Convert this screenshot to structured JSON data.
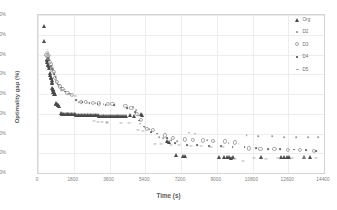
{
  "chart_data": {
    "type": "scatter",
    "title": "",
    "xlabel": "Time (s)",
    "ylabel": "Optimality gap (%)",
    "xlim": [
      0,
      14400
    ],
    "ylim": [
      0,
      0.8
    ],
    "grid": true,
    "legend_position": "right",
    "xticks": [
      "0",
      "1800",
      "3600",
      "5400",
      "7200",
      "9000",
      "10800",
      "12600",
      "14400"
    ],
    "xtick_values": [
      0,
      1800,
      3600,
      5400,
      7200,
      9000,
      10800,
      12600,
      14400
    ],
    "yticks": [
      "0%",
      "10%",
      "20%",
      "30%",
      "40%",
      "50%",
      "60%",
      "70%",
      "80%"
    ],
    "ytick_values": [
      0,
      0.1,
      0.2,
      0.3,
      0.4,
      0.5,
      0.6,
      0.7,
      0.8
    ],
    "series": [
      {
        "name": "Org",
        "marker": "triangle",
        "color": "#4a4a4a",
        "points": [
          [
            300,
            0.742
          ],
          [
            320,
            0.668
          ],
          [
            430,
            0.578
          ],
          [
            470,
            0.572
          ],
          [
            455,
            0.56
          ],
          [
            500,
            0.545
          ],
          [
            520,
            0.552
          ],
          [
            560,
            0.54
          ],
          [
            545,
            0.53
          ],
          [
            600,
            0.505
          ],
          [
            620,
            0.498
          ],
          [
            640,
            0.487
          ],
          [
            660,
            0.48
          ],
          [
            680,
            0.47
          ],
          [
            700,
            0.462
          ],
          [
            690,
            0.455
          ],
          [
            730,
            0.432
          ],
          [
            750,
            0.425
          ],
          [
            770,
            0.418
          ],
          [
            760,
            0.412
          ],
          [
            800,
            0.408
          ],
          [
            820,
            0.4
          ],
          [
            840,
            0.398
          ],
          [
            900,
            0.352
          ],
          [
            930,
            0.35
          ],
          [
            960,
            0.348
          ],
          [
            990,
            0.345
          ],
          [
            1010,
            0.343
          ],
          [
            1040,
            0.34
          ],
          [
            1150,
            0.302
          ],
          [
            1200,
            0.301
          ],
          [
            1260,
            0.3
          ],
          [
            1320,
            0.3
          ],
          [
            1390,
            0.299
          ],
          [
            1450,
            0.299
          ],
          [
            1520,
            0.298
          ],
          [
            1580,
            0.298
          ],
          [
            1650,
            0.298
          ],
          [
            1720,
            0.297
          ],
          [
            1790,
            0.297
          ],
          [
            1860,
            0.297
          ],
          [
            1930,
            0.296
          ],
          [
            2000,
            0.296
          ],
          [
            2080,
            0.296
          ],
          [
            2150,
            0.295
          ],
          [
            2230,
            0.295
          ],
          [
            2300,
            0.295
          ],
          [
            2380,
            0.294
          ],
          [
            2450,
            0.294
          ],
          [
            2530,
            0.294
          ],
          [
            2610,
            0.293
          ],
          [
            2690,
            0.293
          ],
          [
            2770,
            0.293
          ],
          [
            2850,
            0.292
          ],
          [
            2930,
            0.292
          ],
          [
            3010,
            0.292
          ],
          [
            3090,
            0.291
          ],
          [
            3180,
            0.291
          ],
          [
            3260,
            0.291
          ],
          [
            3340,
            0.29
          ],
          [
            3430,
            0.29
          ],
          [
            3510,
            0.29
          ],
          [
            3600,
            0.29
          ],
          [
            3690,
            0.289
          ],
          [
            3780,
            0.289
          ],
          [
            3870,
            0.289
          ],
          [
            3960,
            0.288
          ],
          [
            4050,
            0.288
          ],
          [
            4140,
            0.288
          ],
          [
            4240,
            0.287
          ],
          [
            4330,
            0.287
          ],
          [
            4430,
            0.287
          ],
          [
            4650,
            0.292
          ],
          [
            4820,
            0.29
          ],
          [
            5180,
            0.297
          ],
          [
            5260,
            0.295
          ],
          [
            6480,
            0.16
          ],
          [
            6600,
            0.158
          ],
          [
            6950,
            0.09
          ],
          [
            7300,
            0.088
          ],
          [
            7420,
            0.086
          ],
          [
            9120,
            0.082
          ],
          [
            9350,
            0.08
          ],
          [
            9500,
            0.079
          ],
          [
            9620,
            0.08
          ],
          [
            9700,
            0.078
          ],
          [
            9800,
            0.079
          ],
          [
            11250,
            0.08
          ],
          [
            12250,
            0.082
          ],
          [
            12400,
            0.081
          ],
          [
            12520,
            0.082
          ],
          [
            12650,
            0.08
          ],
          [
            13400,
            0.081
          ],
          [
            13700,
            0.08
          ]
        ]
      },
      {
        "name": "D2",
        "marker": "dot",
        "color": "#9a9a9a",
        "points": [
          [
            480,
            0.625
          ],
          [
            520,
            0.608
          ],
          [
            540,
            0.6
          ],
          [
            660,
            0.54
          ],
          [
            700,
            0.53
          ],
          [
            760,
            0.52
          ],
          [
            810,
            0.505
          ],
          [
            900,
            0.47
          ],
          [
            980,
            0.455
          ],
          [
            1150,
            0.42
          ],
          [
            1260,
            0.418
          ],
          [
            1500,
            0.4
          ],
          [
            1620,
            0.398
          ],
          [
            2050,
            0.358
          ],
          [
            2200,
            0.355
          ],
          [
            2900,
            0.355
          ],
          [
            3100,
            0.352
          ],
          [
            3300,
            0.35
          ],
          [
            4800,
            0.335
          ],
          [
            4950,
            0.318
          ],
          [
            5050,
            0.29
          ],
          [
            5150,
            0.25
          ],
          [
            5400,
            0.23
          ],
          [
            5600,
            0.222
          ],
          [
            6100,
            0.18
          ],
          [
            6300,
            0.175
          ],
          [
            6700,
            0.168
          ],
          [
            7000,
            0.16
          ],
          [
            7600,
            0.205
          ],
          [
            7900,
            0.2
          ],
          [
            8500,
            0.165
          ],
          [
            8900,
            0.16
          ],
          [
            9600,
            0.15
          ],
          [
            10100,
            0.148
          ],
          [
            10500,
            0.19
          ],
          [
            11100,
            0.188
          ],
          [
            11800,
            0.185
          ],
          [
            12400,
            0.183
          ],
          [
            13000,
            0.182
          ],
          [
            13600,
            0.182
          ],
          [
            14100,
            0.18
          ]
        ]
      },
      {
        "name": "D3",
        "marker": "open-circle",
        "color": "#a8a8a8",
        "points": [
          [
            420,
            0.6
          ],
          [
            470,
            0.592
          ],
          [
            510,
            0.585
          ],
          [
            580,
            0.562
          ],
          [
            630,
            0.55
          ],
          [
            720,
            0.525
          ],
          [
            790,
            0.512
          ],
          [
            870,
            0.48
          ],
          [
            940,
            0.462
          ],
          [
            1100,
            0.438
          ],
          [
            1250,
            0.425
          ],
          [
            1480,
            0.405
          ],
          [
            1700,
            0.395
          ],
          [
            2150,
            0.362
          ],
          [
            2400,
            0.358
          ],
          [
            2750,
            0.355
          ],
          [
            3050,
            0.352
          ],
          [
            3500,
            0.35
          ],
          [
            3750,
            0.348
          ],
          [
            4400,
            0.338
          ],
          [
            4700,
            0.33
          ],
          [
            5000,
            0.3
          ],
          [
            5200,
            0.27
          ],
          [
            5500,
            0.222
          ],
          [
            5800,
            0.218
          ],
          [
            6400,
            0.19
          ],
          [
            6800,
            0.178
          ],
          [
            7400,
            0.17
          ],
          [
            7800,
            0.168
          ],
          [
            8300,
            0.165
          ],
          [
            8800,
            0.162
          ],
          [
            9400,
            0.16
          ],
          [
            9900,
            0.155
          ],
          [
            10600,
            0.125
          ],
          [
            11200,
            0.122
          ],
          [
            11900,
            0.12
          ],
          [
            12600,
            0.118
          ],
          [
            13200,
            0.115
          ],
          [
            13900,
            0.112
          ]
        ]
      },
      {
        "name": "D4",
        "marker": "square",
        "color": "#6d6d6d",
        "points": [
          [
            500,
            0.582
          ],
          [
            560,
            0.57
          ],
          [
            640,
            0.54
          ],
          [
            710,
            0.528
          ],
          [
            820,
            0.5
          ],
          [
            890,
            0.485
          ],
          [
            1020,
            0.448
          ],
          [
            1180,
            0.432
          ],
          [
            1350,
            0.412
          ],
          [
            1550,
            0.402
          ],
          [
            1900,
            0.37
          ],
          [
            2250,
            0.36
          ],
          [
            2600,
            0.352
          ],
          [
            3000,
            0.348
          ],
          [
            3400,
            0.345
          ],
          [
            3850,
            0.342
          ],
          [
            4500,
            0.33
          ],
          [
            4900,
            0.31
          ],
          [
            5100,
            0.265
          ],
          [
            5350,
            0.235
          ],
          [
            5700,
            0.208
          ],
          [
            6000,
            0.2
          ],
          [
            6500,
            0.175
          ],
          [
            6900,
            0.15
          ],
          [
            7500,
            0.142
          ],
          [
            8000,
            0.14
          ],
          [
            8600,
            0.138
          ],
          [
            9200,
            0.136
          ],
          [
            9800,
            0.132
          ],
          [
            10400,
            0.13
          ],
          [
            11000,
            0.128
          ],
          [
            11600,
            0.122
          ],
          [
            12200,
            0.12
          ],
          [
            12900,
            0.118
          ],
          [
            13500,
            0.115
          ],
          [
            14000,
            0.112
          ]
        ]
      },
      {
        "name": "D5",
        "marker": "dash",
        "color": "#b0b0b0",
        "points": [
          [
            450,
            0.612
          ],
          [
            530,
            0.595
          ],
          [
            610,
            0.558
          ],
          [
            690,
            0.535
          ],
          [
            780,
            0.508
          ],
          [
            860,
            0.492
          ],
          [
            1080,
            0.442
          ],
          [
            1300,
            0.42
          ],
          [
            1600,
            0.4
          ],
          [
            1850,
            0.388
          ],
          [
            2100,
            0.36
          ],
          [
            2500,
            0.356
          ],
          [
            2800,
            0.262
          ],
          [
            3000,
            0.26
          ],
          [
            3200,
            0.258
          ],
          [
            3450,
            0.256
          ],
          [
            4200,
            0.255
          ],
          [
            4600,
            0.252
          ],
          [
            5050,
            0.218
          ],
          [
            5300,
            0.215
          ],
          [
            5900,
            0.148
          ],
          [
            6200,
            0.145
          ],
          [
            6700,
            0.142
          ],
          [
            7100,
            0.14
          ],
          [
            7700,
            0.138
          ],
          [
            8200,
            0.136
          ],
          [
            8700,
            0.134
          ],
          [
            9300,
            0.132
          ],
          [
            9900,
            0.07
          ],
          [
            10300,
            0.06
          ],
          [
            10900,
            0.075
          ],
          [
            11500,
            0.072
          ],
          [
            12100,
            0.078
          ],
          [
            12800,
            0.076
          ],
          [
            13400,
            0.075
          ],
          [
            14000,
            0.074
          ]
        ]
      }
    ]
  }
}
